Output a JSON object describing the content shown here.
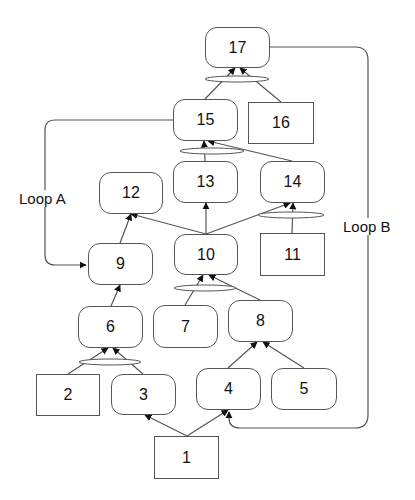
{
  "diagram": {
    "type": "goal/task decomposition graph with AND-joins and loops",
    "colors": {
      "line": "#555555",
      "text": "#111111",
      "background": "#ffffff"
    },
    "nodes": [
      {
        "id": "1",
        "label": "1",
        "shape": "square",
        "x": 154,
        "y": 436,
        "w": 65,
        "h": 43
      },
      {
        "id": "2",
        "label": "2",
        "shape": "square",
        "x": 36,
        "y": 374,
        "w": 64,
        "h": 42
      },
      {
        "id": "3",
        "label": "3",
        "shape": "rounded",
        "x": 111,
        "y": 374,
        "w": 65,
        "h": 41
      },
      {
        "id": "4",
        "label": "4",
        "shape": "rounded",
        "x": 196,
        "y": 368,
        "w": 65,
        "h": 42
      },
      {
        "id": "5",
        "label": "5",
        "shape": "rounded",
        "x": 271,
        "y": 368,
        "w": 66,
        "h": 42
      },
      {
        "id": "6",
        "label": "6",
        "shape": "rounded",
        "x": 78,
        "y": 306,
        "w": 65,
        "h": 42
      },
      {
        "id": "7",
        "label": "7",
        "shape": "rounded",
        "x": 153,
        "y": 305,
        "w": 65,
        "h": 43
      },
      {
        "id": "8",
        "label": "8",
        "shape": "rounded",
        "x": 228,
        "y": 300,
        "w": 65,
        "h": 42
      },
      {
        "id": "9",
        "label": "9",
        "shape": "rounded",
        "x": 88,
        "y": 243,
        "w": 65,
        "h": 42
      },
      {
        "id": "10",
        "label": "10",
        "shape": "rounded",
        "x": 174,
        "y": 234,
        "w": 64,
        "h": 41
      },
      {
        "id": "11",
        "label": "11",
        "shape": "square",
        "x": 260,
        "y": 233,
        "w": 65,
        "h": 43
      },
      {
        "id": "12",
        "label": "12",
        "shape": "rounded",
        "x": 99,
        "y": 172,
        "w": 64,
        "h": 42
      },
      {
        "id": "13",
        "label": "13",
        "shape": "rounded",
        "x": 173,
        "y": 161,
        "w": 65,
        "h": 42
      },
      {
        "id": "14",
        "label": "14",
        "shape": "rounded",
        "x": 260,
        "y": 161,
        "w": 65,
        "h": 42
      },
      {
        "id": "15",
        "label": "15",
        "shape": "rounded",
        "x": 173,
        "y": 99,
        "w": 65,
        "h": 42
      },
      {
        "id": "16",
        "label": "16",
        "shape": "square",
        "x": 248,
        "y": 102,
        "w": 66,
        "h": 42
      },
      {
        "id": "17",
        "label": "17",
        "shape": "rounded",
        "x": 205,
        "y": 27,
        "w": 65,
        "h": 41
      }
    ],
    "edges": [
      {
        "from": "1",
        "to": "3",
        "x1": 187,
        "y1": 436,
        "x2": 145,
        "y2": 415
      },
      {
        "from": "1",
        "to": "4",
        "x1": 187,
        "y1": 436,
        "x2": 228,
        "y2": 410
      },
      {
        "from": "2",
        "to": "6",
        "x1": 68,
        "y1": 374,
        "x2": 108,
        "y2": 348,
        "and_group": "a6"
      },
      {
        "from": "3",
        "to": "6",
        "x1": 143,
        "y1": 374,
        "x2": 113,
        "y2": 348,
        "and_group": "a6"
      },
      {
        "from": "4",
        "to": "8",
        "x1": 228,
        "y1": 368,
        "x2": 257,
        "y2": 342
      },
      {
        "from": "5",
        "to": "8",
        "x1": 304,
        "y1": 368,
        "x2": 263,
        "y2": 342
      },
      {
        "from": "6",
        "to": "9",
        "x1": 111,
        "y1": 306,
        "x2": 120,
        "y2": 285
      },
      {
        "from": "7",
        "to": "10",
        "x1": 185,
        "y1": 305,
        "x2": 203,
        "y2": 275,
        "and_group": "a10"
      },
      {
        "from": "8",
        "to": "10",
        "x1": 260,
        "y1": 300,
        "x2": 209,
        "y2": 275,
        "and_group": "a10"
      },
      {
        "from": "9",
        "to": "12",
        "x1": 120,
        "y1": 243,
        "x2": 131,
        "y2": 214
      },
      {
        "from": "10",
        "to": "12",
        "x1": 206,
        "y1": 234,
        "x2": 131,
        "y2": 214
      },
      {
        "from": "10",
        "to": "13",
        "x1": 206,
        "y1": 234,
        "x2": 206,
        "y2": 203
      },
      {
        "from": "10",
        "to": "14",
        "x1": 206,
        "y1": 234,
        "x2": 290,
        "y2": 203,
        "and_group": "a14"
      },
      {
        "from": "11",
        "to": "14",
        "x1": 292,
        "y1": 233,
        "x2": 293,
        "y2": 203,
        "and_group": "a14"
      },
      {
        "from": "13",
        "to": "15",
        "x1": 205,
        "y1": 161,
        "x2": 204,
        "y2": 141,
        "and_group": "a15"
      },
      {
        "from": "14",
        "to": "15",
        "x1": 292,
        "y1": 161,
        "x2": 208,
        "y2": 141,
        "and_group": "a15"
      },
      {
        "from": "15",
        "to": "17",
        "x1": 205,
        "y1": 99,
        "x2": 235,
        "y2": 68,
        "and_group": "a17"
      },
      {
        "from": "16",
        "to": "17",
        "x1": 281,
        "y1": 102,
        "x2": 240,
        "y2": 68,
        "and_group": "a17"
      }
    ],
    "and_arcs": [
      {
        "id": "a6",
        "cx": 110,
        "cy": 362,
        "rx": 31,
        "ry": 3
      },
      {
        "id": "a10",
        "cx": 205,
        "cy": 288,
        "rx": 31,
        "ry": 3
      },
      {
        "id": "a14",
        "cx": 291,
        "cy": 215,
        "rx": 33,
        "ry": 3
      },
      {
        "id": "a15",
        "cx": 212,
        "cy": 151,
        "rx": 32,
        "ry": 3
      },
      {
        "id": "a17",
        "cx": 237,
        "cy": 79,
        "rx": 32,
        "ry": 3
      }
    ],
    "loops": [
      {
        "id": "loopA",
        "label": "Loop A",
        "from": "15",
        "to": "9",
        "path": "M 173 120 L 55 120 Q 45 120 45 130 L 45 255 Q 45 265 55 265 L 86 265",
        "label_x": 18,
        "label_y": 190
      },
      {
        "id": "loopB",
        "label": "Loop B",
        "from": "17",
        "to": "4",
        "path": "M 270 47 L 355 47 Q 368 47 368 60 L 368 415 Q 368 428 355 428 L 240 428 Q 229 428 229 418 L 229 412",
        "label_x": 342,
        "label_y": 218
      }
    ]
  }
}
